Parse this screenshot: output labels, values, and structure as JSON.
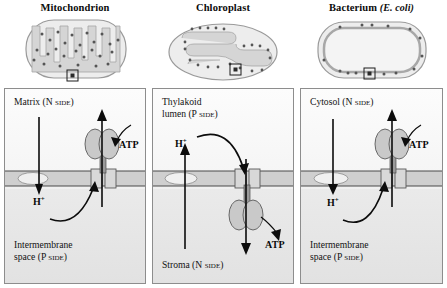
{
  "figure": {
    "type": "biology-diagram"
  },
  "panels": [
    {
      "id": "mitochondrion",
      "title": "Mitochondrion",
      "title_italic": "",
      "organelle_icon": "mitochondrion-icon",
      "callout_marker": "magnified-region-box",
      "top_compartment": {
        "name": "Matrix",
        "side_label": "N side",
        "full": "Matrix (N side)"
      },
      "bottom_compartment": {
        "name": "Intermembrane space",
        "line1": "Intermembrane",
        "line2": "space",
        "side_label": "P side",
        "full": "Intermembrane space (P side)"
      },
      "proton_label": "H",
      "proton_charge": "+",
      "proton_flow": "downward-into-P-side-then-curving-into-synthase",
      "atp_label": "ATP",
      "atp_side": "N side (matrix)",
      "synthase_knob_position": "top (N side)",
      "arrows": [
        {
          "name": "proton-gradient-arrow",
          "direction": "down"
        },
        {
          "name": "proton-return-curve",
          "direction": "curve-up-into-F0"
        },
        {
          "name": "atp-output-arrow",
          "direction": "up"
        },
        {
          "name": "atp-curve",
          "direction": "curve-to-knob"
        }
      ]
    },
    {
      "id": "chloroplast",
      "title": "Chloroplast",
      "title_italic": "",
      "organelle_icon": "chloroplast-icon",
      "callout_marker": "magnified-region-box",
      "top_compartment": {
        "name": "Thylakoid lumen",
        "line1": "Thylakoid",
        "line2": "lumen",
        "side_label": "P side",
        "full": "Thylakoid lumen (P side)"
      },
      "bottom_compartment": {
        "name": "Stroma",
        "side_label": "N side",
        "full": "Stroma (N side)"
      },
      "proton_label": "H",
      "proton_charge": "+",
      "proton_flow": "upward-into-P-side-then-curving-down-into-synthase",
      "atp_label": "ATP",
      "atp_side": "N side (stroma)",
      "synthase_knob_position": "bottom (N side)",
      "arrows": [
        {
          "name": "proton-gradient-arrow",
          "direction": "up"
        },
        {
          "name": "proton-return-curve",
          "direction": "curve-down-into-F0"
        },
        {
          "name": "atp-output-arrow",
          "direction": "down"
        },
        {
          "name": "atp-curve",
          "direction": "curve-to-knob"
        }
      ]
    },
    {
      "id": "bacterium",
      "title": "Bacterium",
      "title_italic": "(E. coli)",
      "organelle_icon": "bacterium-icon",
      "callout_marker": "magnified-region-box",
      "top_compartment": {
        "name": "Cytosol",
        "side_label": "N side",
        "full": "Cytosol (N side)"
      },
      "bottom_compartment": {
        "name": "Intermembrane space",
        "line1": "Intermembrane",
        "line2": "space",
        "side_label": "P side",
        "full": "Intermembrane space (P side)"
      },
      "proton_label": "H",
      "proton_charge": "+",
      "proton_flow": "downward-into-P-side-then-curving-into-synthase",
      "atp_label": "ATP",
      "atp_side": "N side (cytosol)",
      "synthase_knob_position": "top (N side)",
      "arrows": [
        {
          "name": "proton-gradient-arrow",
          "direction": "down"
        },
        {
          "name": "proton-return-curve",
          "direction": "curve-up-into-F0"
        },
        {
          "name": "atp-output-arrow",
          "direction": "up"
        },
        {
          "name": "atp-curve",
          "direction": "curve-to-knob"
        }
      ]
    }
  ],
  "colors": {
    "background": "#ffffff",
    "panel_border": "#8d8d8d",
    "upper_compartment": "#f8f8f8",
    "lower_compartment": "#e6e6e6",
    "membrane": "#cfcfcf",
    "membrane_line": "#4a4a4a",
    "synthase_fill": "#c9c9c9",
    "arrow": "#0c0c0c",
    "text": "#121212",
    "organelle_fill": "#ededed",
    "organelle_inner": "#d5d5d5",
    "particle_dot": "#555555"
  }
}
